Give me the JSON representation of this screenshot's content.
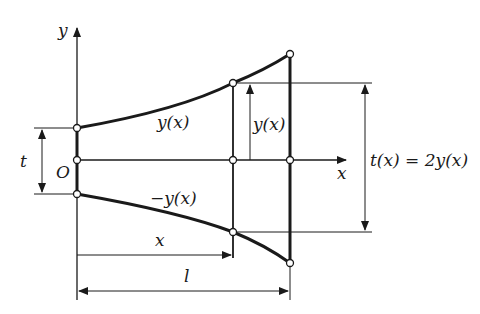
{
  "diagram": {
    "type": "beam-profile-dimension-drawing",
    "labels": {
      "y_axis": "y",
      "x_axis": "x",
      "origin": "O",
      "thickness": "t",
      "upper_curve": "y(x)",
      "lower_curve": "−y(x)",
      "half_height": "y(x)",
      "total_height": "t(x) = 2y(x)",
      "position": "x",
      "length": "l"
    },
    "colors": {
      "line": "#1a1a1a",
      "background": "#ffffff"
    }
  }
}
